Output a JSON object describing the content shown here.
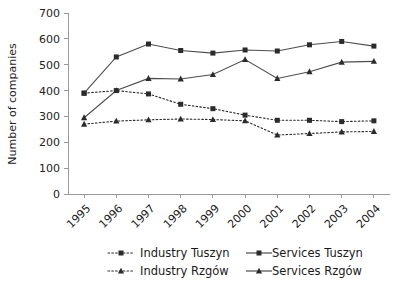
{
  "chart_data": {
    "type": "line",
    "title": "",
    "xlabel": "",
    "ylabel": "Number of companies",
    "categories": [
      "1995",
      "1996",
      "1997",
      "1998",
      "1999",
      "2000",
      "2001",
      "2002",
      "2003",
      "2004"
    ],
    "ylim": [
      0,
      700
    ],
    "yticks": [
      0,
      100,
      200,
      300,
      400,
      500,
      600,
      700
    ],
    "grid": false,
    "legend_position": "bottom",
    "series": [
      {
        "name": "Industry Tuszyn",
        "style": "dotted",
        "marker": "square",
        "color": "#2b2b2b",
        "values": [
          390,
          400,
          387,
          347,
          330,
          305,
          285,
          285,
          280,
          283
        ]
      },
      {
        "name": "Services Tuszyn",
        "style": "solid",
        "marker": "square",
        "color": "#4d4d4d",
        "values": [
          390,
          530,
          580,
          555,
          545,
          557,
          553,
          577,
          590,
          572
        ]
      },
      {
        "name": "Industry Rzgów",
        "style": "dotted",
        "marker": "triangle",
        "color": "#2b2b2b",
        "values": [
          270,
          282,
          287,
          290,
          288,
          283,
          228,
          234,
          240,
          242
        ]
      },
      {
        "name": "Services Rzgów",
        "style": "solid",
        "marker": "triangle",
        "color": "#4d4d4d",
        "values": [
          295,
          400,
          447,
          445,
          462,
          520,
          447,
          473,
          510,
          513
        ]
      }
    ]
  },
  "legend": {
    "entries": [
      {
        "label": "Industry Tuszyn",
        "style": "dotted",
        "marker": "square"
      },
      {
        "label": "Services Tuszyn",
        "style": "solid",
        "marker": "square"
      },
      {
        "label": "Industry Rzgów",
        "style": "dotted",
        "marker": "triangle"
      },
      {
        "label": "Services Rzgów",
        "style": "solid",
        "marker": "triangle"
      }
    ]
  }
}
